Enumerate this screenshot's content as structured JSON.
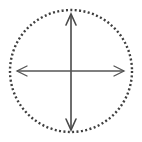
{
  "figure": {
    "name": "dotted-circle-with-crossed-double-arrows",
    "canvas": {
      "width": 142,
      "height": 142,
      "background_color": "#ffffff"
    },
    "colors": {
      "stroke": "#4a4a4a",
      "dot": "#3f3f3f",
      "background": "#ffffff"
    },
    "circle": {
      "label": "dotted-boundary-circle",
      "center_x": 71,
      "center_y": 71,
      "radius": 61,
      "style": "dotted",
      "dot_size": 2,
      "dot_gap": 2.4,
      "stroke_width": 2.4,
      "stroke_color": "#3f3f3f"
    },
    "arrows": [
      {
        "label": "vertical-double-arrow",
        "orientation": "vertical",
        "x1": 71,
        "y1": 14,
        "x2": 71,
        "y2": 130,
        "stroke_width": 1.6,
        "stroke_color": "#4a4a4a",
        "head_length": 11,
        "head_half_width": 5,
        "double_headed": true
      },
      {
        "label": "horizontal-double-arrow",
        "orientation": "horizontal",
        "x1": 17,
        "y1": 71,
        "x2": 124,
        "y2": 71,
        "stroke_width": 1.3,
        "stroke_color": "#555555",
        "head_length": 10,
        "head_half_width": 5,
        "double_headed": true
      }
    ],
    "center_point": {
      "label": "intersection-center",
      "x": 71,
      "y": 71
    }
  }
}
